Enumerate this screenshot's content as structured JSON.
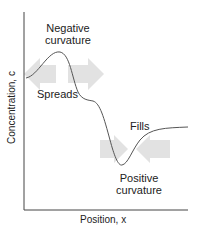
{
  "diagram": {
    "labels": {
      "negative_line1": "Negative",
      "negative_line2": "curvature",
      "spreads": "Spreads",
      "fills": "Fills",
      "positive_line1": "Positive",
      "positive_line2": "curvature"
    },
    "axes": {
      "ylabel": "Concentration, c",
      "xlabel": "Position, x"
    },
    "colors": {
      "curve": "#555555",
      "axis": "#444444",
      "arrow": "#e2e2e2",
      "text": "#222222"
    },
    "arrows": [
      {
        "region": "spreads",
        "direction": "left"
      },
      {
        "region": "spreads",
        "direction": "right"
      },
      {
        "region": "fills",
        "direction": "right"
      },
      {
        "region": "fills",
        "direction": "left"
      }
    ]
  }
}
